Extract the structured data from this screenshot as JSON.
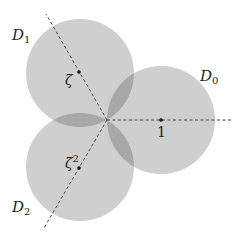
{
  "diagram": {
    "origin": {
      "x": 107,
      "y": 120
    },
    "radius": 54,
    "colors": {
      "disk_fill": "#cfcfcf",
      "overlap_fill": "#a8a8a8",
      "line": "#444444",
      "text": "#222222",
      "background": "#ffffff"
    },
    "disks": [
      {
        "id": "D0",
        "label_base": "D",
        "label_sub": "0",
        "cx": 161,
        "cy": 120,
        "center_label": "1",
        "center_label_sup": ""
      },
      {
        "id": "D1",
        "label_base": "D",
        "label_sub": "1",
        "cx": 80,
        "cy": 73,
        "center_label": "ζ",
        "center_label_sup": ""
      },
      {
        "id": "D2",
        "label_base": "D",
        "label_sub": "2",
        "cx": 80,
        "cy": 167,
        "center_label": "ζ",
        "center_label_sup": "2"
      }
    ],
    "rays": [
      {
        "to": "D0",
        "x2": 232,
        "y2": 120
      },
      {
        "to": "D1",
        "x2": 46,
        "y2": 14
      },
      {
        "to": "D2",
        "x2": 44,
        "y2": 228
      }
    ]
  }
}
